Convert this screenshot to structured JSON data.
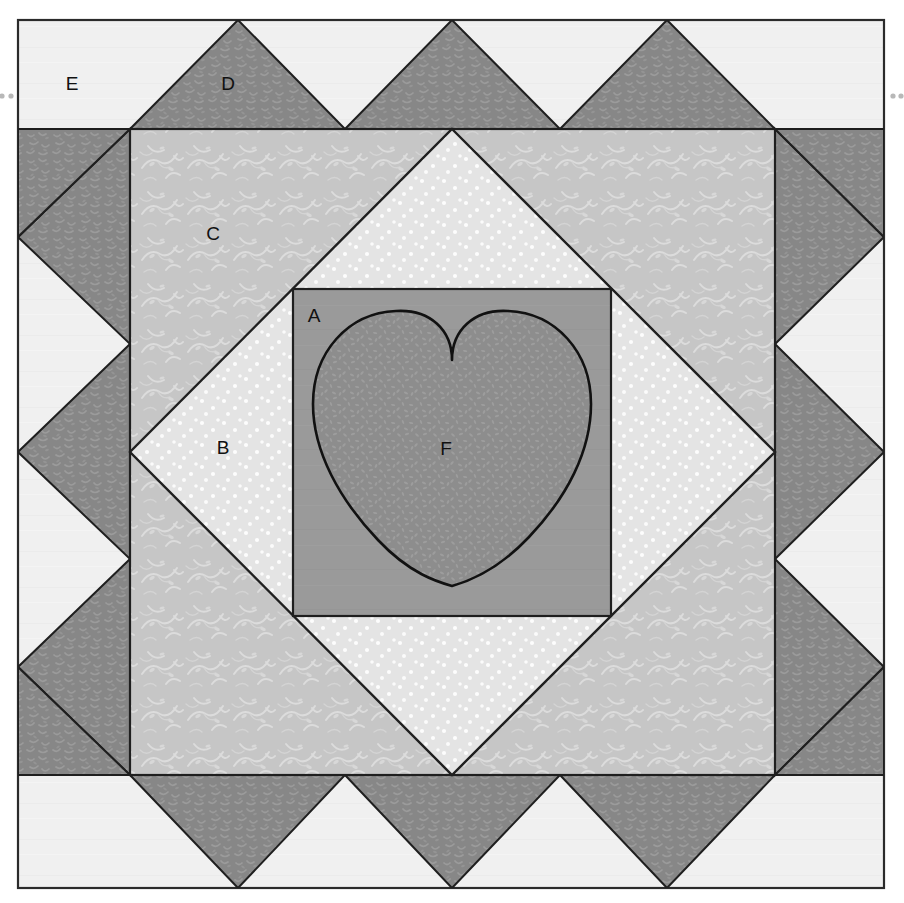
{
  "diagram": {
    "type": "quilt-block-schematic",
    "canvas": {
      "width": 904,
      "height": 903
    },
    "background_color": "#ffffff",
    "outline_color": "#1a1a1a"
  },
  "frame": {
    "x": 18,
    "y": 20,
    "width": 866,
    "height": 868,
    "stroke": "#2b2b2b"
  },
  "registration_marks": {
    "name": "seam-allowance-dots",
    "color": "#b8b8b8",
    "left": [
      {
        "x": 3,
        "y": 96
      },
      {
        "x": 10,
        "y": 96
      }
    ],
    "right": [
      {
        "x": 893,
        "y": 96
      },
      {
        "x": 900,
        "y": 96
      }
    ]
  },
  "pieces": [
    {
      "id": "A",
      "label": "A",
      "name": "center-background-square",
      "fabric": "solid medium gray",
      "color": "#9a9a9a",
      "label_x": 314,
      "label_y": 317,
      "geometry": {
        "shape": "square",
        "x": 293,
        "y": 289,
        "width": 318,
        "height": 327
      }
    },
    {
      "id": "B",
      "label": "B",
      "name": "on-point-diamond",
      "fabric": "light dotted print",
      "color": "#e4e4e4",
      "label_x": 223,
      "label_y": 449,
      "geometry": {
        "shape": "diamond-in-square",
        "cx": 452,
        "cy": 452,
        "half": 322
      }
    },
    {
      "id": "C",
      "label": "C",
      "name": "corner-triangle-frame",
      "fabric": "light gray vine print",
      "color": "#c6c6c6",
      "label_x": 213,
      "label_y": 235,
      "geometry": {
        "shape": "square",
        "x": 130,
        "y": 129,
        "width": 645,
        "height": 646
      }
    },
    {
      "id": "D",
      "label": "D",
      "name": "outer-point-triangle",
      "fabric": "dark gray mottled print",
      "color": "#878787",
      "label_x": 228,
      "label_y": 85,
      "geometry": {
        "shape": "triangle-band",
        "count": 12
      }
    },
    {
      "id": "E",
      "label": "E",
      "name": "background-corner",
      "fabric": "off-white solid",
      "color": "#f0f0f0",
      "label_x": 72,
      "label_y": 85,
      "geometry": {
        "shape": "background-field"
      }
    },
    {
      "id": "F",
      "label": "F",
      "name": "heart-applique",
      "fabric": "dark gray textured print",
      "color": "#8d8d8d",
      "label_x": 446,
      "label_y": 450,
      "geometry": {
        "shape": "heart",
        "cleft_x": 452,
        "cleft_y": 360,
        "tip_x": 452,
        "tip_y": 586
      }
    }
  ],
  "legend_order": [
    "A",
    "B",
    "C",
    "D",
    "E",
    "F"
  ]
}
